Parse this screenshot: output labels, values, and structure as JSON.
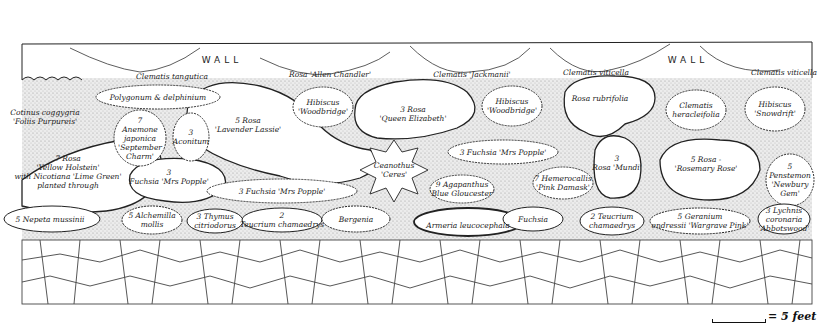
{
  "wall": {
    "labels": [
      "WALL",
      "WALL"
    ]
  },
  "scale": {
    "label": "= 5 feet"
  },
  "climbers": [
    {
      "id": "clematis-tangutica",
      "lines": [
        "Clematis tangutica"
      ],
      "x": 172,
      "y": 76
    },
    {
      "id": "rosa-allen-chandler",
      "lines": [
        "Rosa 'Allen Chandler'"
      ],
      "x": 330,
      "y": 74
    },
    {
      "id": "clematis-jackmanii",
      "lines": [
        "Clematis 'Jackmanii'"
      ],
      "x": 472,
      "y": 74
    },
    {
      "id": "clematis-viticella-1",
      "lines": [
        "Clematis viticella"
      ],
      "x": 596,
      "y": 72
    },
    {
      "id": "clematis-viticella-2",
      "lines": [
        "Clematis viticella"
      ],
      "x": 784,
      "y": 72
    }
  ],
  "beds": [
    {
      "id": "polygonum",
      "lines": [
        "Polygonum & delphinium"
      ],
      "x": 158,
      "y": 97
    },
    {
      "id": "cotinus",
      "lines": [
        "Cotinus coggygria",
        "'Foliis Purpureis'"
      ],
      "x": 45,
      "y": 117
    },
    {
      "id": "anemone",
      "lines": [
        "7",
        "Anemone",
        "japonica",
        "'September",
        "Charm'"
      ],
      "x": 140,
      "y": 138
    },
    {
      "id": "aconitum",
      "lines": [
        "3",
        "Aconitum"
      ],
      "x": 191,
      "y": 137
    },
    {
      "id": "rosa-lavender",
      "lines": [
        "5 Rosa",
        "'Lavender Lassie'"
      ],
      "x": 248,
      "y": 125
    },
    {
      "id": "hibiscus-woodbridge-1",
      "lines": [
        "Hibiscus",
        "'Woodbridge'"
      ],
      "x": 323,
      "y": 107
    },
    {
      "id": "rosa-queen",
      "lines": [
        "3 Rosa",
        "'Queen Elizabeth'"
      ],
      "x": 413,
      "y": 114
    },
    {
      "id": "hibiscus-woodbridge-2",
      "lines": [
        "Hibiscus",
        "'Woodbridge'"
      ],
      "x": 512,
      "y": 106
    },
    {
      "id": "rosa-rubrifolia",
      "lines": [
        "Rosa rubrifolia"
      ],
      "x": 600,
      "y": 98
    },
    {
      "id": "clematis-heracleifolia",
      "lines": [
        "Clematis",
        "heracleifolia"
      ],
      "x": 696,
      "y": 110
    },
    {
      "id": "hibiscus-snowdrift",
      "lines": [
        "Hibiscus",
        "'Snowdrift'"
      ],
      "x": 775,
      "y": 109
    },
    {
      "id": "rosa-yellow-holstein",
      "lines": [
        "7 Rosa",
        "'Yellow Holstein'",
        "with Nicotiana 'Lime Green'",
        "planted through"
      ],
      "x": 68,
      "y": 172
    },
    {
      "id": "fuchsia-popple-1",
      "lines": [
        "3",
        "Fuchsia 'Mrs Popple'"
      ],
      "x": 169,
      "y": 177
    },
    {
      "id": "fuchsia-popple-2",
      "lines": [
        "3 Fuchsia 'Mrs Popple'"
      ],
      "x": 282,
      "y": 191
    },
    {
      "id": "ceanothus",
      "lines": [
        "Ceanothus",
        "'Ceres'"
      ],
      "x": 394,
      "y": 170
    },
    {
      "id": "fuchsia-popple-3",
      "lines": [
        "3 Fuchsia 'Mrs Popple'"
      ],
      "x": 503,
      "y": 152
    },
    {
      "id": "agapanthus",
      "lines": [
        "9 Agapanthus",
        "'Blue Gloucester'"
      ],
      "x": 462,
      "y": 189
    },
    {
      "id": "hemerocallis",
      "lines": [
        "7 Hemerocallis",
        "'Pink Damask'"
      ],
      "x": 563,
      "y": 183
    },
    {
      "id": "rosa-mundi",
      "lines": [
        "3",
        "Rosa 'Mundi'"
      ],
      "x": 617,
      "y": 163
    },
    {
      "id": "rosa-rosemary",
      "lines": [
        "5 Rosa -",
        "'Rosemary Rose'"
      ],
      "x": 706,
      "y": 164
    },
    {
      "id": "penstemon",
      "lines": [
        "5",
        "Penstemon",
        "'Newbury",
        "Gem'"
      ],
      "x": 790,
      "y": 180
    }
  ],
  "front_row": [
    {
      "id": "nepeta",
      "lines": [
        "5 Nepeta mussinii"
      ],
      "x": 50,
      "y": 219
    },
    {
      "id": "alchemilla",
      "lines": [
        "5 Alchemilla",
        "mollis"
      ],
      "x": 152,
      "y": 220
    },
    {
      "id": "thymus",
      "lines": [
        "3 Thymus",
        "citriodorus"
      ],
      "x": 215,
      "y": 221
    },
    {
      "id": "teucrium-1",
      "lines": [
        "2",
        "Teucrium chamaedrys"
      ],
      "x": 282,
      "y": 220
    },
    {
      "id": "bergenia",
      "lines": [
        "Bergenia"
      ],
      "x": 356,
      "y": 219
    },
    {
      "id": "armeria",
      "lines": [
        "Armeria leucocephala"
      ],
      "x": 468,
      "y": 225
    },
    {
      "id": "fuchsia-front",
      "lines": [
        "Fuchsia"
      ],
      "x": 533,
      "y": 219
    },
    {
      "id": "teucrium-2",
      "lines": [
        "2 Teucrium",
        "chamaedrys"
      ],
      "x": 612,
      "y": 221
    },
    {
      "id": "geranium",
      "lines": [
        "5 Geranium",
        "endressii 'Wargrave Pink'"
      ],
      "x": 700,
      "y": 221
    },
    {
      "id": "lychnis",
      "lines": [
        "3 Lychnis",
        "coronaria",
        "'Abbotswood'"
      ],
      "x": 784,
      "y": 219
    }
  ],
  "colors": {
    "ink": "#222222",
    "gravel": "#d9d9d9",
    "paper": "#ffffff"
  }
}
